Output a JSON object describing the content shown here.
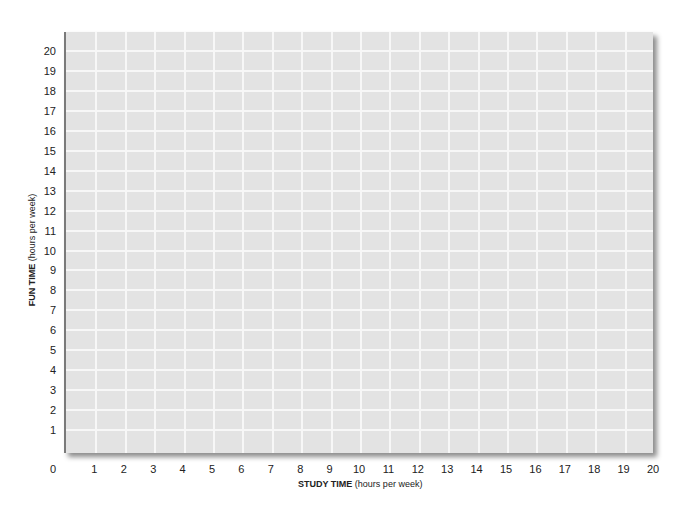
{
  "chart_data": {
    "type": "scatter",
    "title": "",
    "xlabel": "STUDY TIME (hours per week)",
    "xlabel_bold": "STUDY TIME",
    "xlabel_rest": "(hours per week)",
    "ylabel": "FUN TIME (hours per week)",
    "ylabel_bold": "FUN TIME",
    "ylabel_rest": "(hours per week)",
    "xlim": [
      0,
      20
    ],
    "ylim": [
      0,
      20
    ],
    "x_ticks": [
      "0",
      "1",
      "2",
      "3",
      "4",
      "5",
      "6",
      "7",
      "8",
      "9",
      "10",
      "11",
      "12",
      "13",
      "14",
      "15",
      "16",
      "17",
      "18",
      "19",
      "20"
    ],
    "y_ticks": [
      "1",
      "2",
      "3",
      "4",
      "5",
      "6",
      "7",
      "8",
      "9",
      "10",
      "11",
      "12",
      "13",
      "14",
      "15",
      "16",
      "17",
      "18",
      "19",
      "20"
    ],
    "grid": true,
    "series": [],
    "legend": null,
    "colors": {
      "plot_background": "#e3e3e3",
      "grid": "#f7f7f7",
      "axis": "#7a7a7a"
    }
  }
}
